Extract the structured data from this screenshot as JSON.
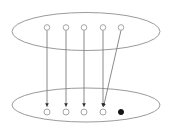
{
  "figure": {
    "kind": "set-mapping-diagram",
    "background": "#ffffff",
    "canvas": {
      "width": 171,
      "height": 131
    },
    "colors": {
      "ellipse_stroke": "#8f8f8f",
      "node_stroke": "#9b9b9b",
      "node_fill": "#ffffff",
      "line_color": "#7d7d7d",
      "arrowhead_color": "#2b2b2b",
      "filled_node_color": "#151515"
    },
    "top_set": {
      "ellipse": {
        "cx": 86,
        "cy": 31.5,
        "rx": 74,
        "ry": 19
      },
      "nodes": [
        {
          "cx": 47,
          "cy": 27.5,
          "r": 2.8,
          "filled": false
        },
        {
          "cx": 66,
          "cy": 27.5,
          "r": 2.8,
          "filled": false
        },
        {
          "cx": 84,
          "cy": 27.5,
          "r": 2.8,
          "filled": false
        },
        {
          "cx": 103,
          "cy": 27.5,
          "r": 2.8,
          "filled": false
        },
        {
          "cx": 121,
          "cy": 27.5,
          "r": 2.8,
          "filled": false
        }
      ]
    },
    "bottom_set": {
      "ellipse": {
        "cx": 86,
        "cy": 105,
        "rx": 74,
        "ry": 17
      },
      "nodes": [
        {
          "cx": 47,
          "cy": 112,
          "r": 3.0,
          "filled": false
        },
        {
          "cx": 66,
          "cy": 112,
          "r": 3.0,
          "filled": false
        },
        {
          "cx": 84,
          "cy": 112,
          "r": 3.0,
          "filled": false
        },
        {
          "cx": 103,
          "cy": 112,
          "r": 3.0,
          "filled": false
        },
        {
          "cx": 121,
          "cy": 112,
          "r": 2.6,
          "filled": true
        }
      ]
    },
    "arrows": [
      {
        "from_node": 0,
        "to_node": 0
      },
      {
        "from_node": 1,
        "to_node": 1
      },
      {
        "from_node": 2,
        "to_node": 2
      },
      {
        "from_node": 3,
        "to_node": 3
      },
      {
        "from_node": 4,
        "to_node": 3
      }
    ]
  }
}
